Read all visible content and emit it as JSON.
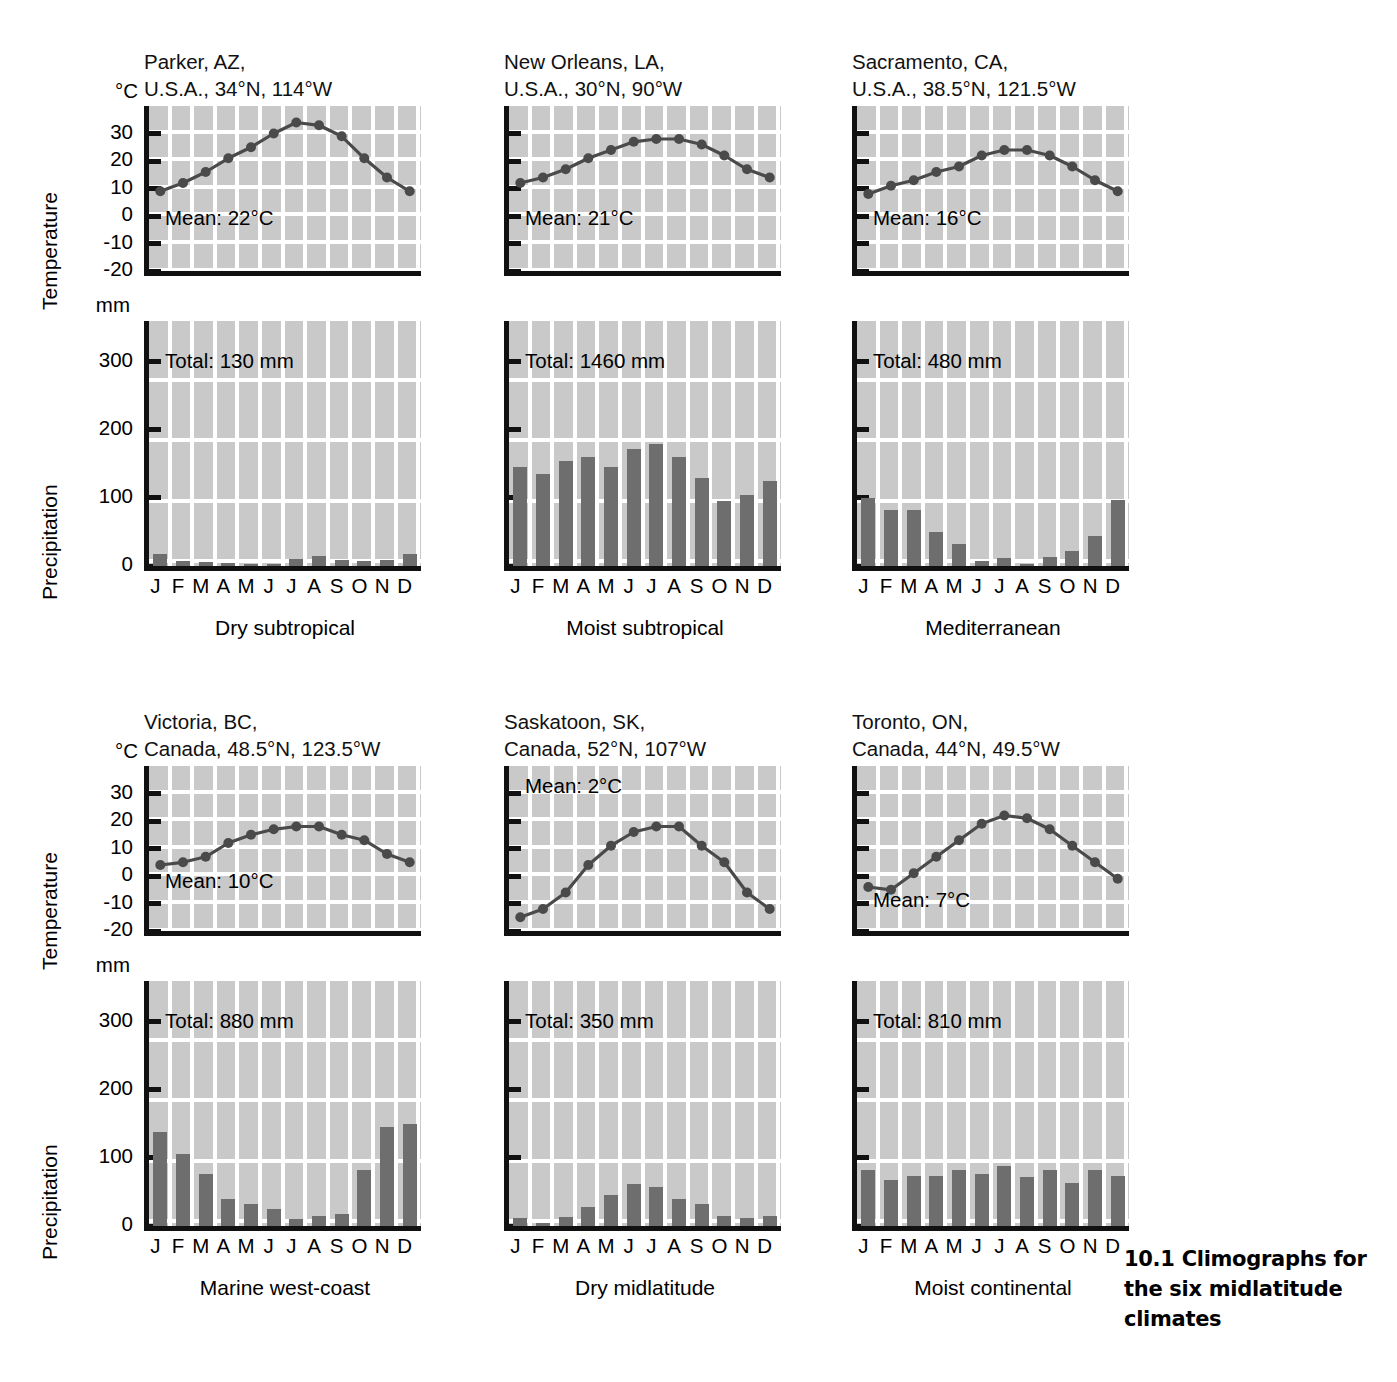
{
  "figure": {
    "caption_number": "10.1",
    "caption_text": "Climographs for the six midlatitude climates"
  },
  "axis_titles": {
    "temperature": "Temperature",
    "precipitation": "Precipitation"
  },
  "units": {
    "temperature": "°C",
    "precipitation": "mm"
  },
  "temperature_ticks": [
    "30",
    "20",
    "10",
    "0",
    "-10",
    "-20"
  ],
  "precipitation_ticks": [
    "300",
    "200",
    "100",
    "0"
  ],
  "months": [
    "J",
    "F",
    "M",
    "A",
    "M",
    "J",
    "J",
    "A",
    "S",
    "O",
    "N",
    "D"
  ],
  "colors": {
    "plot_background": "#c9c9c9",
    "gridline": "#ffffff",
    "axis": "#111111",
    "bar": "#6e6e6e",
    "temperature_line": "#4a4a4a",
    "marker": "#4a4a4a"
  },
  "chart_data": [
    {
      "type": "line",
      "panel": "parker-temperature",
      "title": "Parker, AZ,\nU.S.A., 34°N, 114°W",
      "station": "Parker, AZ",
      "country_coords": "U.S.A., 34°N, 114°W",
      "climate_type": "Dry subtropical",
      "ylabel": "Temperature",
      "yunit": "°C",
      "ylim": [
        -20,
        40
      ],
      "ytick_labels": [
        "30",
        "20",
        "10",
        "0",
        "-10",
        "-20"
      ],
      "categories": [
        "J",
        "F",
        "M",
        "A",
        "M",
        "J",
        "J",
        "A",
        "S",
        "O",
        "N",
        "D"
      ],
      "values": [
        9,
        12,
        16,
        21,
        25,
        30,
        34,
        33,
        29,
        21,
        14,
        9
      ],
      "annotation": "Mean: 22°C",
      "grid": true,
      "legend": "none"
    },
    {
      "type": "bar",
      "panel": "parker-precipitation",
      "climate_type": "Dry subtropical",
      "ylabel": "Precipitation",
      "yunit": "mm",
      "ylim": [
        0,
        360
      ],
      "ytick_labels": [
        "300",
        "200",
        "100",
        "0"
      ],
      "categories": [
        "J",
        "F",
        "M",
        "A",
        "M",
        "J",
        "J",
        "A",
        "S",
        "O",
        "N",
        "D"
      ],
      "values": [
        18,
        8,
        6,
        5,
        3,
        1,
        10,
        15,
        9,
        7,
        9,
        18
      ],
      "annotation": "Total: 130 mm",
      "grid": true,
      "legend": "none"
    },
    {
      "type": "line",
      "panel": "new-orleans-temperature",
      "title": "New Orleans, LA,\nU.S.A., 30°N, 90°W",
      "station": "New Orleans, LA",
      "country_coords": "U.S.A., 30°N, 90°W",
      "climate_type": "Moist subtropical",
      "ylabel": "Temperature",
      "yunit": "°C",
      "ylim": [
        -20,
        40
      ],
      "ytick_labels": [
        "30",
        "20",
        "10",
        "0",
        "-10",
        "-20"
      ],
      "categories": [
        "J",
        "F",
        "M",
        "A",
        "M",
        "J",
        "J",
        "A",
        "S",
        "O",
        "N",
        "D"
      ],
      "values": [
        12,
        14,
        17,
        21,
        24,
        27,
        28,
        28,
        26,
        22,
        17,
        14
      ],
      "annotation": "Mean: 21°C",
      "grid": true,
      "legend": "none"
    },
    {
      "type": "bar",
      "panel": "new-orleans-precipitation",
      "climate_type": "Moist subtropical",
      "ylabel": "Precipitation",
      "yunit": "mm",
      "ylim": [
        0,
        360
      ],
      "ytick_labels": [
        "300",
        "200",
        "100",
        "0"
      ],
      "categories": [
        "J",
        "F",
        "M",
        "A",
        "M",
        "J",
        "J",
        "A",
        "S",
        "O",
        "N",
        "D"
      ],
      "values": [
        145,
        135,
        155,
        160,
        145,
        172,
        180,
        160,
        130,
        95,
        105,
        125
      ],
      "annotation": "Total: 1460 mm",
      "grid": true,
      "legend": "none"
    },
    {
      "type": "line",
      "panel": "sacramento-temperature",
      "title": "Sacramento, CA,\nU.S.A., 38.5°N, 121.5°W",
      "station": "Sacramento, CA",
      "country_coords": "U.S.A., 38.5°N, 121.5°W",
      "climate_type": "Mediterranean",
      "ylabel": "Temperature",
      "yunit": "°C",
      "ylim": [
        -20,
        40
      ],
      "ytick_labels": [
        "30",
        "20",
        "10",
        "0",
        "-10",
        "-20"
      ],
      "categories": [
        "J",
        "F",
        "M",
        "A",
        "M",
        "J",
        "J",
        "A",
        "S",
        "O",
        "N",
        "D"
      ],
      "values": [
        8,
        11,
        13,
        16,
        18,
        22,
        24,
        24,
        22,
        18,
        13,
        9
      ],
      "annotation": "Mean: 16°C",
      "grid": true,
      "legend": "none"
    },
    {
      "type": "bar",
      "panel": "sacramento-precipitation",
      "climate_type": "Mediterranean",
      "ylabel": "Precipitation",
      "yunit": "mm",
      "ylim": [
        0,
        360
      ],
      "ytick_labels": [
        "300",
        "200",
        "100",
        "0"
      ],
      "categories": [
        "J",
        "F",
        "M",
        "A",
        "M",
        "J",
        "J",
        "A",
        "S",
        "O",
        "N",
        "D"
      ],
      "values": [
        100,
        82,
        82,
        50,
        33,
        8,
        12,
        3,
        13,
        22,
        44,
        97
      ],
      "annotation": "Total: 480 mm",
      "grid": true,
      "legend": "none"
    },
    {
      "type": "line",
      "panel": "victoria-temperature",
      "title": "Victoria, BC,\nCanada, 48.5°N, 123.5°W",
      "station": "Victoria, BC",
      "country_coords": "Canada, 48.5°N, 123.5°W",
      "climate_type": "Marine west-coast",
      "ylabel": "Temperature",
      "yunit": "°C",
      "ylim": [
        -20,
        40
      ],
      "ytick_labels": [
        "30",
        "20",
        "10",
        "0",
        "-10",
        "-20"
      ],
      "categories": [
        "J",
        "F",
        "M",
        "A",
        "M",
        "J",
        "J",
        "A",
        "S",
        "O",
        "N",
        "D"
      ],
      "values": [
        4,
        5,
        7,
        12,
        15,
        17,
        18,
        18,
        15,
        13,
        8,
        5
      ],
      "annotation": "Mean: 10°C",
      "grid": true,
      "legend": "none"
    },
    {
      "type": "bar",
      "panel": "victoria-precipitation",
      "climate_type": "Marine west-coast",
      "ylabel": "Precipitation",
      "yunit": "mm",
      "ylim": [
        0,
        360
      ],
      "ytick_labels": [
        "300",
        "200",
        "100",
        "0"
      ],
      "categories": [
        "J",
        "F",
        "M",
        "A",
        "M",
        "J",
        "J",
        "A",
        "S",
        "O",
        "N",
        "D"
      ],
      "values": [
        138,
        106,
        77,
        40,
        33,
        25,
        10,
        15,
        18,
        83,
        145,
        150
      ],
      "annotation": "Total: 880 mm",
      "grid": true,
      "legend": "none"
    },
    {
      "type": "line",
      "panel": "saskatoon-temperature",
      "title": "Saskatoon, SK,\nCanada, 52°N, 107°W",
      "station": "Saskatoon, SK",
      "country_coords": "Canada, 52°N, 107°W",
      "climate_type": "Dry midlatitude",
      "ylabel": "Temperature",
      "yunit": "°C",
      "ylim": [
        -20,
        40
      ],
      "ytick_labels": [
        "30",
        "20",
        "10",
        "0",
        "-10",
        "-20"
      ],
      "categories": [
        "J",
        "F",
        "M",
        "A",
        "M",
        "J",
        "J",
        "A",
        "S",
        "O",
        "N",
        "D"
      ],
      "values": [
        -15,
        -12,
        -6,
        4,
        11,
        16,
        18,
        18,
        11,
        5,
        -6,
        -12
      ],
      "annotation": "Mean: 2°C",
      "grid": true,
      "legend": "none"
    },
    {
      "type": "bar",
      "panel": "saskatoon-precipitation",
      "climate_type": "Dry midlatitude",
      "ylabel": "Precipitation",
      "yunit": "mm",
      "ylim": [
        0,
        360
      ],
      "ytick_labels": [
        "300",
        "200",
        "100",
        "0"
      ],
      "categories": [
        "J",
        "F",
        "M",
        "A",
        "M",
        "J",
        "J",
        "A",
        "S",
        "O",
        "N",
        "D"
      ],
      "values": [
        12,
        5,
        13,
        28,
        45,
        62,
        58,
        40,
        33,
        15,
        12,
        14
      ],
      "annotation": "Total: 350 mm",
      "grid": true,
      "legend": "none"
    },
    {
      "type": "line",
      "panel": "toronto-temperature",
      "title": "Toronto, ON,\nCanada, 44°N, 49.5°W",
      "station": "Toronto, ON",
      "country_coords": "Canada, 44°N, 49.5°W",
      "climate_type": "Moist continental",
      "ylabel": "Temperature",
      "yunit": "°C",
      "ylim": [
        -20,
        40
      ],
      "ytick_labels": [
        "30",
        "20",
        "10",
        "0",
        "-10",
        "-20"
      ],
      "categories": [
        "J",
        "F",
        "M",
        "A",
        "M",
        "J",
        "J",
        "A",
        "S",
        "O",
        "N",
        "D"
      ],
      "values": [
        -4,
        -5,
        1,
        7,
        13,
        19,
        22,
        21,
        17,
        11,
        5,
        -1
      ],
      "annotation": "Mean: 7°C",
      "grid": true,
      "legend": "none"
    },
    {
      "type": "bar",
      "panel": "toronto-precipitation",
      "climate_type": "Moist continental",
      "ylabel": "Precipitation",
      "yunit": "mm",
      "ylim": [
        0,
        360
      ],
      "ytick_labels": [
        "300",
        "200",
        "100",
        "0"
      ],
      "categories": [
        "J",
        "F",
        "M",
        "A",
        "M",
        "J",
        "J",
        "A",
        "S",
        "O",
        "N",
        "D"
      ],
      "values": [
        82,
        68,
        74,
        74,
        82,
        76,
        88,
        72,
        82,
        63,
        83,
        74
      ],
      "annotation": "Total: 810 mm",
      "grid": true,
      "legend": "none"
    }
  ]
}
